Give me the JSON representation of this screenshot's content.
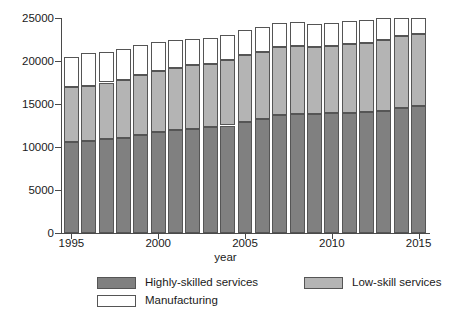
{
  "chart_data": {
    "type": "bar",
    "subtype": "stacked-bar",
    "title": "",
    "xlabel": "year",
    "ylabel": "",
    "xlim": [
      1994.4,
      2015.6
    ],
    "ylim": [
      0,
      25000
    ],
    "grid": false,
    "legend_position": "bottom",
    "categories": [
      "1995",
      "1996",
      "1997",
      "1998",
      "1999",
      "1200",
      "2001",
      "2002",
      "2003",
      "2004",
      "2005",
      "2006",
      "2007",
      "2008",
      "2009",
      "2010",
      "2011",
      "2012",
      "2013",
      "2014",
      "2015"
    ],
    "x": [
      1995,
      1996,
      1997,
      1998,
      1999,
      2000,
      2001,
      2002,
      2003,
      2004,
      2005,
      2006,
      2007,
      2008,
      2009,
      2010,
      2011,
      2012,
      2013,
      2014,
      2015
    ],
    "series": [
      {
        "name": "Highly-skilled services",
        "color": "#808080",
        "values": [
          10600,
          10700,
          10900,
          11100,
          11400,
          11700,
          12000,
          12150,
          12300,
          12500,
          12900,
          13300,
          13700,
          13850,
          13850,
          13900,
          14000,
          14050,
          14200,
          14500,
          14800
        ]
      },
      {
        "name": "Low-skill services",
        "color": "#b4b4b4",
        "values": [
          6400,
          6400,
          6600,
          6700,
          6950,
          7100,
          7200,
          7350,
          7350,
          7600,
          7750,
          7800,
          7900,
          7900,
          7800,
          7900,
          8000,
          8100,
          8200,
          8400,
          8300
        ]
      },
      {
        "name": "Manufacturing",
        "color": "#ffffff",
        "values": [
          3500,
          3800,
          3600,
          3600,
          3500,
          3400,
          3200,
          3100,
          3050,
          2950,
          2950,
          2900,
          2850,
          2800,
          2650,
          2600,
          2600,
          2600,
          2650,
          2100,
          1900
        ]
      }
    ],
    "totals": [
      20500,
      20900,
      21100,
      21400,
      21850,
      22200,
      22400,
      22600,
      22700,
      23050,
      23600,
      24000,
      24450,
      24550,
      24300,
      24400,
      24600,
      24750,
      25050,
      25000,
      25000
    ],
    "yticks": [
      {
        "value": 0,
        "label": "0"
      },
      {
        "value": 5000,
        "label": "5000"
      },
      {
        "value": 10000,
        "label": "10000"
      },
      {
        "value": 15000,
        "label": "15000"
      },
      {
        "value": 20000,
        "label": "20000"
      },
      {
        "value": 25000,
        "label": "25000"
      }
    ],
    "xticks": [
      {
        "value": 1995,
        "label": "1995"
      },
      {
        "value": 2000,
        "label": "2000"
      },
      {
        "value": 2005,
        "label": "2005"
      },
      {
        "value": 2010,
        "label": "2010"
      },
      {
        "value": 2015,
        "label": "2015"
      }
    ],
    "legend": [
      {
        "label": "Highly-skilled services",
        "color": "#808080"
      },
      {
        "label": "Low-skill services",
        "color": "#b4b4b4"
      },
      {
        "label": "Manufacturing",
        "color": "#ffffff"
      }
    ]
  },
  "axis": {
    "xlabel": "year"
  },
  "legend": {
    "highly_skilled": "Highly-skilled services",
    "low_skill": "Low-skill services",
    "manufacturing": "Manufacturing"
  }
}
